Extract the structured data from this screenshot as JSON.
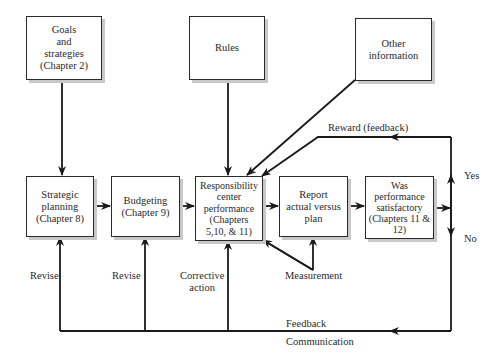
{
  "diagram": {
    "boxes": {
      "goals": "Goals\nand\nstrategies\n(Chapter 2)",
      "rules": "Rules",
      "other_info": "Other\ninformation",
      "strategic_planning": "Strategic\nplanning\n(Chapter 8)",
      "budgeting": "Budgeting\n(Chapter 9)",
      "responsibility": "Responsibility\ncenter\nperformance\n(Chapters\n5,10, & 11)",
      "report": "Report\nactual versus\nplan",
      "was_performance": "Was\nperformance\nsatisfactory\n(Chapters 11 & 12)"
    },
    "labels": {
      "reward": "Reward (feedback)",
      "yes": "Yes",
      "no": "No",
      "revise_1": "Revise",
      "revise_2": "Revise",
      "corrective": "Corrective\naction",
      "measurement": "Measurement",
      "feedback": "Feedback",
      "communication": "Communication"
    },
    "colors": {
      "line": "#1a1a1a",
      "shadow": "#c8c8c8",
      "background": "#ffffff"
    }
  }
}
